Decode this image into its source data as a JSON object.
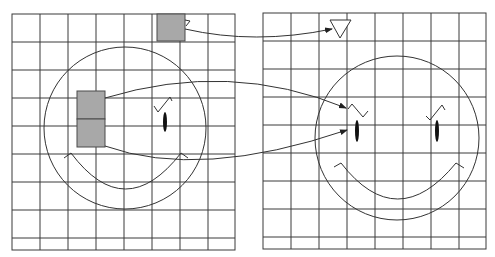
{
  "diagram": {
    "colors": {
      "background": "#ffffff",
      "grid": "#3a3a3a",
      "patch_fill": "#a8a8a8",
      "patch_stroke": "#4a4a4a",
      "line": "#333333",
      "eye": "#111111"
    },
    "left_panel": {
      "grid": {
        "x": 12,
        "y": 14,
        "w": 223,
        "h": 236,
        "cols": [
          12,
          40,
          68,
          96,
          124,
          152,
          180,
          208,
          235
        ],
        "rows": [
          14,
          42,
          70,
          98,
          126,
          154,
          182,
          210,
          238,
          250
        ]
      },
      "face": {
        "cx": 125,
        "cy": 128,
        "r": 81
      },
      "patches": [
        {
          "name": "patch-top",
          "x": 157,
          "y": 14,
          "w": 28,
          "h": 27
        },
        {
          "name": "patch-upper",
          "x": 77,
          "y": 91,
          "w": 28,
          "h": 28
        },
        {
          "name": "patch-lower",
          "x": 77,
          "y": 119,
          "w": 28,
          "h": 28
        }
      ]
    },
    "right_panel": {
      "grid": {
        "x": 263,
        "y": 13,
        "w": 223,
        "h": 236,
        "cols": [
          263,
          291,
          319,
          347,
          375,
          403,
          431,
          459,
          486
        ],
        "rows": [
          13,
          41,
          69,
          97,
          125,
          153,
          181,
          209,
          237,
          249
        ]
      },
      "face": {
        "cx": 397,
        "cy": 138,
        "r": 82
      },
      "triangle": {
        "points": "330,20 351,20 340,38"
      }
    },
    "arrows": [
      {
        "name": "arrow-triangle",
        "from": "patch-top",
        "to": "triangle"
      },
      {
        "name": "arrow-eyebrow",
        "from": "patch-upper",
        "to": "left-eyebrow"
      },
      {
        "name": "arrow-eye",
        "from": "patch-lower",
        "to": "left-eye"
      }
    ]
  }
}
